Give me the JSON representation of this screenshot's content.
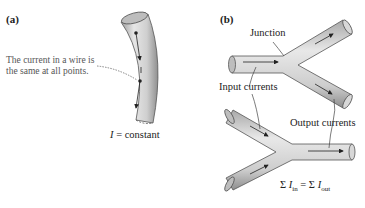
{
  "figure": {
    "panel_a": {
      "label": "(a)",
      "annotation_line1": "The current in a wire is",
      "annotation_line2": "the same at all points.",
      "equation_symbol": "I",
      "equation_rest": " = constant"
    },
    "panel_b": {
      "label": "(b)",
      "junction_label": "Junction",
      "input_label": "Input currents",
      "output_label": "Output currents",
      "equation": {
        "sum1": "Σ ",
        "I1": "I",
        "sub1": "in",
        "eq": " = Σ ",
        "I2": "I",
        "sub2": "out"
      }
    },
    "colors": {
      "wire_fill": "#c9c9c9",
      "wire_highlight": "#e8e8e8",
      "wire_edge": "#555555",
      "arrow": "#222222",
      "leader_line": "#777777"
    }
  }
}
